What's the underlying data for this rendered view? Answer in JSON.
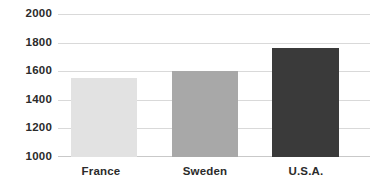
{
  "chart_data": {
    "type": "bar",
    "title": "",
    "subtitle": "",
    "xlabel": "",
    "ylabel": "",
    "categories": [
      "France",
      "Sweden",
      "U.S.A."
    ],
    "values": [
      1555,
      1600,
      1765
    ],
    "series": [
      {
        "name": "",
        "values": [
          1555,
          1600,
          1765
        ]
      }
    ],
    "bar_colors": [
      "#e2e2e2",
      "#a8a8a8",
      "#3a3a3a"
    ],
    "ylim": [
      1000,
      2000
    ],
    "yticks": [
      2000,
      1800,
      1600,
      1400,
      1200,
      1000
    ],
    "ytick_labels": [
      "2000",
      "1800",
      "1600",
      "1400",
      "1200",
      "1000"
    ],
    "grid": true,
    "grid_axis": "y",
    "legend": false,
    "legend_position": "none",
    "background_color": "#ffffff",
    "grid_color": "#d9d9d9",
    "label_color": "#2b2b2b",
    "annotations": []
  }
}
